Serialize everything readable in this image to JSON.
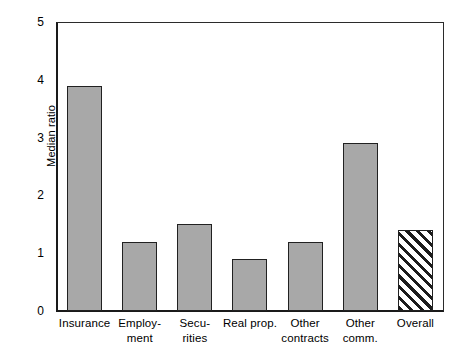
{
  "chart_data": {
    "type": "bar",
    "title": "",
    "xlabel": "",
    "ylabel": "Median ratio",
    "ylim": [
      0,
      5
    ],
    "yticks": [
      0,
      1,
      2,
      3,
      4,
      5
    ],
    "ytick_labels": [
      "0",
      "1",
      "2",
      "3",
      "4",
      "5"
    ],
    "grid": false,
    "legend": "none",
    "categories": [
      "Insurance",
      "Employment",
      "Securities",
      "Real prop.",
      "Other contracts",
      "Other comm.",
      "Overall"
    ],
    "category_label_lines": [
      [
        "Insurance"
      ],
      [
        "Employ-",
        "ment"
      ],
      [
        "Secu-",
        "rities"
      ],
      [
        "Real prop."
      ],
      [
        "Other",
        "contracts"
      ],
      [
        "Other",
        "comm."
      ],
      [
        "Overall"
      ]
    ],
    "values": [
      3.9,
      1.2,
      1.5,
      0.9,
      1.2,
      2.9,
      1.4
    ],
    "bar_styles": [
      "solid",
      "solid",
      "solid",
      "solid",
      "solid",
      "solid",
      "hatched"
    ],
    "colors": {
      "bar_fill": "#a8a8a8",
      "bar_edge": "#212121",
      "hatch_color": "#1c1c1c",
      "axis": "#1a1a1a",
      "frame": "#2b2b2b",
      "background": "#ffffff"
    }
  }
}
